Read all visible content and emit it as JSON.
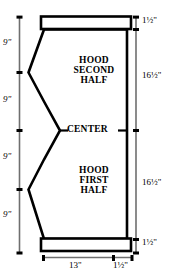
{
  "drawing": {
    "title": "Hood Pattern Layout",
    "parts": [
      {
        "name": "hood-second-half",
        "lines": [
          "HOOD",
          "SECOND",
          "HALF"
        ]
      },
      {
        "name": "hood-first-half",
        "lines": [
          "HOOD",
          "FIRST",
          "HALF"
        ]
      }
    ],
    "center_label": "CENTER",
    "dimensions": {
      "left": [
        {
          "id": "left-1",
          "label": "9\""
        },
        {
          "id": "left-2",
          "label": "9\""
        },
        {
          "id": "left-3",
          "label": "9\""
        },
        {
          "id": "left-4",
          "label": "9\""
        }
      ],
      "right": [
        {
          "id": "right-top-seam",
          "label": "1½\""
        },
        {
          "id": "right-second-half",
          "label": "16½\""
        },
        {
          "id": "right-first-half",
          "label": "16½\""
        },
        {
          "id": "right-bottom-seam",
          "label": "1½\""
        }
      ],
      "bottom": [
        {
          "id": "bottom-width",
          "label": "13\""
        },
        {
          "id": "bottom-seam",
          "label": "1½\""
        }
      ]
    },
    "colors": {
      "ink": "#000000",
      "paper": "#ffffff",
      "dimension_rule": "#6b6b6b"
    }
  }
}
